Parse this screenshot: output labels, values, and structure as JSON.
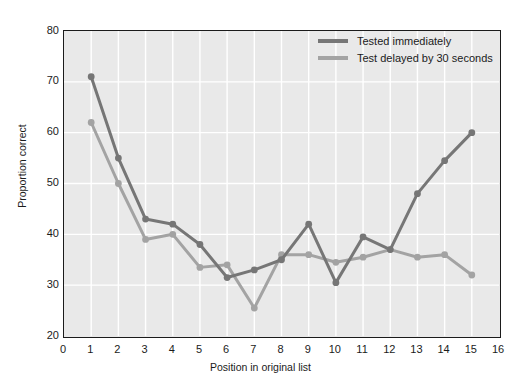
{
  "figure": {
    "top_remnant_text": "",
    "background_color": "#ffffff",
    "plot_background_color": "#e9e9e9",
    "grid_color": "#ffffff",
    "frame_color": "#1b1b1b"
  },
  "axes": {
    "ylabel": "Proportion correct",
    "xlabel": "Position in original list",
    "yticks": [
      "20",
      "30",
      "40",
      "50",
      "60",
      "70",
      "80"
    ],
    "xticks": [
      "0",
      "1",
      "2",
      "3",
      "4",
      "5",
      "6",
      "7",
      "8",
      "9",
      "10",
      "11",
      "12",
      "13",
      "14",
      "15",
      "16"
    ]
  },
  "legend": {
    "position": "top-right-inside",
    "entries": [
      {
        "label": "Tested immediately",
        "color": "#767676"
      },
      {
        "label": "Test delayed by 30 seconds",
        "color": "#a3a3a3"
      }
    ]
  },
  "chart_data": {
    "type": "line",
    "title": "",
    "xlabel": "Position in original list",
    "ylabel": "Proportion correct",
    "xlim": [
      0,
      16
    ],
    "ylim": [
      20,
      80
    ],
    "xticks": [
      0,
      1,
      2,
      3,
      4,
      5,
      6,
      7,
      8,
      9,
      10,
      11,
      12,
      13,
      14,
      15,
      16
    ],
    "yticks": [
      20,
      30,
      40,
      50,
      60,
      70,
      80
    ],
    "grid": true,
    "legend_position": "upper right",
    "markers": "filled-circle",
    "x": [
      1,
      2,
      3,
      4,
      5,
      6,
      7,
      8,
      9,
      10,
      11,
      12,
      13,
      14,
      15
    ],
    "series": [
      {
        "name": "Tested immediately",
        "color": "#767676",
        "values": [
          71,
          55,
          43,
          42,
          38,
          31.5,
          33,
          35,
          42,
          30.5,
          39.5,
          37,
          48,
          54.5,
          60
        ]
      },
      {
        "name": "Test delayed by 30 seconds",
        "color": "#a3a3a3",
        "values": [
          62,
          50,
          39,
          40,
          33.5,
          34,
          25.5,
          36,
          36,
          34.5,
          35.5,
          37,
          35.5,
          36,
          32
        ]
      }
    ]
  }
}
